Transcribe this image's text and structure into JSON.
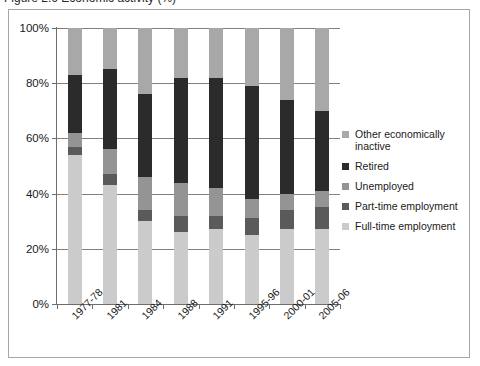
{
  "caption": {
    "text": "Figure 2.6 Economic activity (%)"
  },
  "chart_data": {
    "type": "bar",
    "stacked": true,
    "title": "",
    "xlabel": "",
    "ylabel": "",
    "ylim": [
      0,
      100
    ],
    "ytick_labels": [
      "0%",
      "20%",
      "40%",
      "60%",
      "80%",
      "100%"
    ],
    "ytick_values": [
      0,
      20,
      40,
      60,
      80,
      100
    ],
    "grid": true,
    "legend_position": "right",
    "categories": [
      "1977-78",
      "1981",
      "1984",
      "1988",
      "1991",
      "1995-96",
      "2000-01",
      "2005-06"
    ],
    "series": [
      {
        "name": "Full-time employment",
        "color": "#cbcbcb",
        "values": [
          54,
          43,
          30,
          26,
          27,
          25,
          27,
          27
        ]
      },
      {
        "name": "Part-time employment",
        "color": "#5a5a5a",
        "values": [
          3,
          4,
          4,
          6,
          5,
          6,
          7,
          8
        ]
      },
      {
        "name": "Unemployed",
        "color": "#949494",
        "values": [
          5,
          9,
          12,
          12,
          10,
          7,
          6,
          6
        ]
      },
      {
        "name": "Retired",
        "color": "#2b2b2b",
        "values": [
          21,
          29,
          30,
          38,
          40,
          41,
          34,
          29
        ]
      },
      {
        "name": "Other economically inactive",
        "color": "#a8a8a8",
        "values": [
          17,
          15,
          24,
          18,
          18,
          21,
          26,
          30
        ]
      }
    ]
  },
  "legend": {
    "items": [
      {
        "label": "Other economically inactive",
        "color": "#a8a8a8"
      },
      {
        "label": "Retired",
        "color": "#2b2b2b"
      },
      {
        "label": "Unemployed",
        "color": "#949494"
      },
      {
        "label": "Part-time employment",
        "color": "#5a5a5a"
      },
      {
        "label": "Full-time employment",
        "color": "#cbcbcb"
      }
    ]
  }
}
